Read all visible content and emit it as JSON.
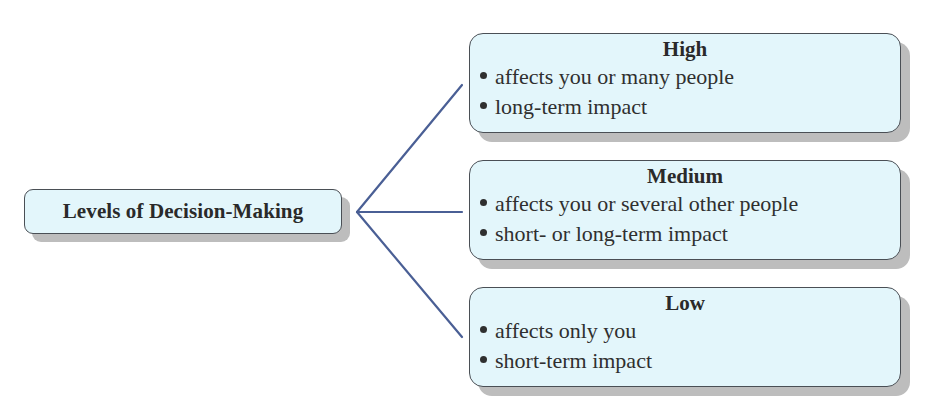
{
  "diagram": {
    "root": {
      "title": "Levels of Decision-Making"
    },
    "levels": [
      {
        "title": "High",
        "bullets": [
          "affects you or many people",
          "long-term impact"
        ]
      },
      {
        "title": "Medium",
        "bullets": [
          "affects you or several other people",
          "short- or long-term impact"
        ]
      },
      {
        "title": "Low",
        "bullets": [
          "affects only you",
          "short-term impact"
        ]
      }
    ],
    "colors": {
      "box_fill": "#e3f6fb",
      "box_border": "#4a4f55",
      "shadow": "#bdbdbd",
      "connector": "#4a5f95",
      "text": "#2a2a2a"
    }
  }
}
